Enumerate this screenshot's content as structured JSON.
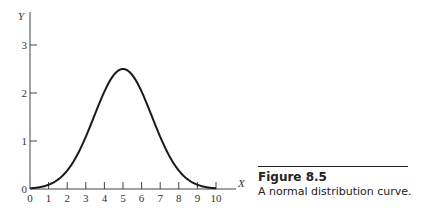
{
  "caption": {
    "title": "Figure 8.5",
    "text": "A normal distribution curve."
  },
  "chart_data": {
    "type": "line",
    "title": "A normal distribution curve.",
    "xlabel": "X",
    "ylabel": "Y",
    "xlim": [
      0,
      10
    ],
    "ylim": [
      0,
      3.5
    ],
    "xticks": [
      0,
      1,
      2,
      3,
      4,
      5,
      6,
      7,
      8,
      9,
      10
    ],
    "yticks": [
      0,
      1,
      2,
      3
    ],
    "grid": false,
    "legend": null,
    "series": [
      {
        "name": "normal curve",
        "mean": 5,
        "peak": 2.5,
        "x": [
          0,
          0.5,
          1,
          1.5,
          2,
          2.5,
          3,
          3.5,
          4,
          4.5,
          5,
          5.5,
          6,
          6.5,
          7,
          7.5,
          8,
          8.5,
          9,
          9.5,
          10
        ],
        "y": [
          0.04,
          0.08,
          0.15,
          0.27,
          0.45,
          0.7,
          1.02,
          1.4,
          1.82,
          2.25,
          2.5,
          2.25,
          1.82,
          1.4,
          1.02,
          0.7,
          0.45,
          0.27,
          0.15,
          0.08,
          0.04
        ]
      }
    ]
  }
}
